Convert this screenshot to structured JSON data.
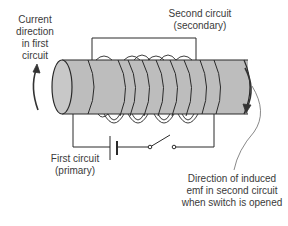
{
  "diagram": {
    "type": "mutual-induction",
    "colors": {
      "cylinder_fill": "#bdbdbd",
      "cylinder_end": "#c8c8c8",
      "stroke": "#2a2a2a",
      "text": "#3a3a3a",
      "background": "#ffffff"
    },
    "labels": {
      "current_direction": [
        "Current",
        "direction",
        "in first",
        "circuit"
      ],
      "second_circuit": [
        "Second circuit",
        "(secondary)"
      ],
      "first_circuit": [
        "First circuit",
        "(primary)"
      ],
      "induced_emf": [
        "Direction of induced",
        "emf in second circuit",
        "when switch is opened"
      ]
    },
    "components": [
      {
        "name": "iron-core-cylinder"
      },
      {
        "name": "primary-coil"
      },
      {
        "name": "secondary-coil"
      },
      {
        "name": "battery"
      },
      {
        "name": "switch",
        "state": "open"
      }
    ]
  }
}
